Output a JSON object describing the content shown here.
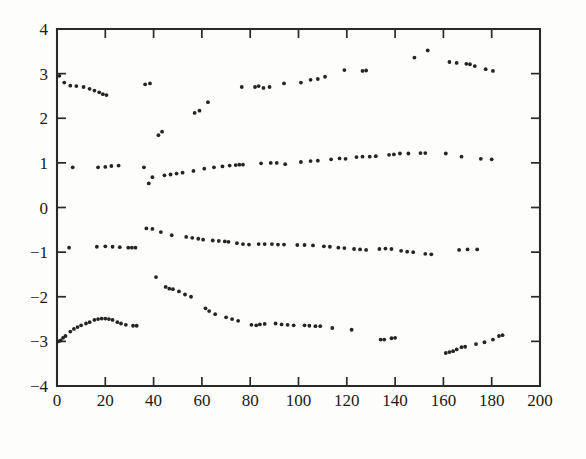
{
  "chart_data": {
    "type": "scatter",
    "title": "",
    "subtitle": "",
    "xlabel": "",
    "ylabel": "",
    "xlim": [
      0,
      200
    ],
    "ylim": [
      -4,
      4
    ],
    "grid": false,
    "legend": null,
    "legend_position": "none",
    "x_ticks": [
      0,
      20,
      40,
      60,
      80,
      100,
      120,
      140,
      160,
      180,
      200
    ],
    "x_tick_labels": [
      "0",
      "20",
      "40",
      "60",
      "80",
      "100",
      "120",
      "140",
      "160",
      "180",
      "200"
    ],
    "y_ticks": [
      -4,
      -3,
      -2,
      -1,
      0,
      1,
      2,
      3,
      4
    ],
    "y_tick_labels": [
      "−4",
      "−3",
      "−2",
      "−1",
      "0",
      "1",
      "2",
      "3",
      "4"
    ],
    "marker": "dot",
    "marker_size": 1.9,
    "marker_color": "#242424",
    "series": [
      {
        "name": "band-upper",
        "points": [
          [
            1.0,
            2.95
          ],
          [
            3.0,
            2.8
          ],
          [
            5.5,
            2.73
          ],
          [
            8.0,
            2.72
          ],
          [
            11.0,
            2.7
          ],
          [
            13.5,
            2.66
          ],
          [
            15.5,
            2.62
          ],
          [
            17.5,
            2.58
          ],
          [
            19.0,
            2.54
          ],
          [
            20.5,
            2.52
          ],
          [
            36.5,
            2.76
          ],
          [
            38.5,
            2.78
          ],
          [
            42.0,
            1.62
          ],
          [
            43.5,
            1.7
          ],
          [
            57.0,
            2.12
          ],
          [
            59.0,
            2.17
          ],
          [
            62.5,
            2.36
          ],
          [
            76.5,
            2.7
          ],
          [
            82.0,
            2.7
          ],
          [
            83.5,
            2.72
          ],
          [
            85.5,
            2.68
          ],
          [
            88.0,
            2.7
          ],
          [
            94.0,
            2.78
          ],
          [
            101.0,
            2.8
          ],
          [
            105.0,
            2.86
          ],
          [
            108.0,
            2.88
          ],
          [
            111.0,
            2.93
          ],
          [
            119.0,
            3.08
          ],
          [
            126.5,
            3.06
          ],
          [
            128.0,
            3.07
          ],
          [
            148.0,
            3.36
          ],
          [
            153.5,
            3.52
          ],
          [
            162.5,
            3.26
          ],
          [
            165.5,
            3.24
          ],
          [
            169.5,
            3.22
          ],
          [
            171.0,
            3.21
          ],
          [
            173.0,
            3.17
          ],
          [
            177.5,
            3.1
          ],
          [
            180.5,
            3.06
          ]
        ]
      },
      {
        "name": "band-one",
        "points": [
          [
            6.5,
            0.9
          ],
          [
            17.0,
            0.9
          ],
          [
            20.0,
            0.91
          ],
          [
            22.5,
            0.93
          ],
          [
            25.5,
            0.94
          ],
          [
            36.0,
            0.9
          ],
          [
            38.0,
            0.54
          ],
          [
            39.5,
            0.68
          ],
          [
            44.5,
            0.72
          ],
          [
            47.0,
            0.74
          ],
          [
            49.5,
            0.76
          ],
          [
            52.0,
            0.78
          ],
          [
            56.5,
            0.82
          ],
          [
            61.0,
            0.87
          ],
          [
            65.0,
            0.9
          ],
          [
            68.5,
            0.92
          ],
          [
            71.5,
            0.94
          ],
          [
            74.0,
            0.95
          ],
          [
            75.5,
            0.96
          ],
          [
            77.0,
            0.96
          ],
          [
            84.5,
            0.99
          ],
          [
            88.5,
            1.0
          ],
          [
            91.0,
            1.0
          ],
          [
            94.5,
            0.97
          ],
          [
            101.0,
            1.02
          ],
          [
            105.0,
            1.04
          ],
          [
            108.0,
            1.05
          ],
          [
            113.5,
            1.08
          ],
          [
            117.0,
            1.1
          ],
          [
            119.5,
            1.09
          ],
          [
            124.0,
            1.13
          ],
          [
            126.5,
            1.14
          ],
          [
            129.5,
            1.14
          ],
          [
            132.0,
            1.15
          ],
          [
            137.5,
            1.18
          ],
          [
            139.5,
            1.19
          ],
          [
            142.0,
            1.21
          ],
          [
            145.5,
            1.21
          ],
          [
            150.5,
            1.22
          ],
          [
            152.5,
            1.22
          ],
          [
            161.0,
            1.21
          ],
          [
            167.5,
            1.14
          ],
          [
            175.5,
            1.09
          ],
          [
            180.0,
            1.08
          ]
        ]
      },
      {
        "name": "band-minus-one",
        "points": [
          [
            5.0,
            -0.9
          ],
          [
            16.5,
            -0.88
          ],
          [
            20.0,
            -0.87
          ],
          [
            23.0,
            -0.88
          ],
          [
            26.0,
            -0.89
          ],
          [
            29.5,
            -0.9
          ],
          [
            31.0,
            -0.9
          ],
          [
            32.5,
            -0.9
          ],
          [
            37.0,
            -0.47
          ],
          [
            39.5,
            -0.48
          ],
          [
            43.0,
            -0.55
          ],
          [
            47.5,
            -0.62
          ],
          [
            53.5,
            -0.66
          ],
          [
            56.0,
            -0.68
          ],
          [
            58.5,
            -0.7
          ],
          [
            60.5,
            -0.72
          ],
          [
            64.5,
            -0.74
          ],
          [
            67.0,
            -0.75
          ],
          [
            69.5,
            -0.76
          ],
          [
            71.0,
            -0.77
          ],
          [
            74.5,
            -0.8
          ],
          [
            77.0,
            -0.82
          ],
          [
            79.5,
            -0.83
          ],
          [
            83.5,
            -0.82
          ],
          [
            86.0,
            -0.82
          ],
          [
            89.0,
            -0.82
          ],
          [
            91.5,
            -0.83
          ],
          [
            94.0,
            -0.83
          ],
          [
            99.5,
            -0.84
          ],
          [
            102.5,
            -0.84
          ],
          [
            106.0,
            -0.85
          ],
          [
            110.5,
            -0.87
          ],
          [
            113.0,
            -0.88
          ],
          [
            116.5,
            -0.9
          ],
          [
            119.0,
            -0.91
          ],
          [
            123.0,
            -0.93
          ],
          [
            125.5,
            -0.94
          ],
          [
            128.0,
            -0.95
          ],
          [
            133.5,
            -0.93
          ],
          [
            136.0,
            -0.92
          ],
          [
            138.5,
            -0.93
          ],
          [
            142.5,
            -0.97
          ],
          [
            145.0,
            -0.99
          ],
          [
            147.5,
            -1.0
          ],
          [
            152.5,
            -1.04
          ],
          [
            155.0,
            -1.05
          ],
          [
            166.5,
            -0.95
          ],
          [
            170.0,
            -0.94
          ],
          [
            174.0,
            -0.94
          ]
        ]
      },
      {
        "name": "band-lower",
        "points": [
          [
            0.5,
            -3.0
          ],
          [
            1.5,
            -2.98
          ],
          [
            2.5,
            -2.92
          ],
          [
            3.5,
            -2.88
          ],
          [
            5.5,
            -2.78
          ],
          [
            7.0,
            -2.72
          ],
          [
            8.5,
            -2.68
          ],
          [
            10.0,
            -2.64
          ],
          [
            12.0,
            -2.6
          ],
          [
            13.5,
            -2.57
          ],
          [
            15.5,
            -2.52
          ],
          [
            17.0,
            -2.5
          ],
          [
            18.5,
            -2.49
          ],
          [
            20.0,
            -2.49
          ],
          [
            21.5,
            -2.5
          ],
          [
            23.0,
            -2.52
          ],
          [
            25.0,
            -2.57
          ],
          [
            26.5,
            -2.6
          ],
          [
            28.5,
            -2.63
          ],
          [
            31.5,
            -2.65
          ],
          [
            33.0,
            -2.65
          ],
          [
            41.0,
            -1.56
          ],
          [
            45.0,
            -1.78
          ],
          [
            46.5,
            -1.82
          ],
          [
            48.0,
            -1.83
          ],
          [
            50.5,
            -1.88
          ],
          [
            53.0,
            -1.95
          ],
          [
            55.5,
            -2.0
          ],
          [
            61.5,
            -2.26
          ],
          [
            63.0,
            -2.32
          ],
          [
            65.5,
            -2.39
          ],
          [
            70.0,
            -2.46
          ],
          [
            72.5,
            -2.5
          ],
          [
            75.0,
            -2.54
          ],
          [
            80.5,
            -2.63
          ],
          [
            82.5,
            -2.64
          ],
          [
            84.0,
            -2.62
          ],
          [
            86.0,
            -2.61
          ],
          [
            90.5,
            -2.6
          ],
          [
            93.0,
            -2.62
          ],
          [
            95.5,
            -2.63
          ],
          [
            98.0,
            -2.64
          ],
          [
            102.5,
            -2.64
          ],
          [
            104.5,
            -2.65
          ],
          [
            107.0,
            -2.66
          ],
          [
            109.0,
            -2.66
          ],
          [
            114.0,
            -2.7
          ],
          [
            122.0,
            -2.74
          ],
          [
            134.0,
            -2.96
          ],
          [
            135.5,
            -2.96
          ],
          [
            138.5,
            -2.93
          ],
          [
            140.0,
            -2.92
          ],
          [
            161.0,
            -3.26
          ],
          [
            162.5,
            -3.24
          ],
          [
            164.0,
            -3.22
          ],
          [
            165.5,
            -3.18
          ],
          [
            167.5,
            -3.13
          ],
          [
            169.0,
            -3.12
          ],
          [
            173.5,
            -3.06
          ],
          [
            177.0,
            -3.02
          ],
          [
            180.5,
            -2.96
          ],
          [
            183.0,
            -2.88
          ],
          [
            184.5,
            -2.86
          ]
        ]
      }
    ]
  },
  "figure": {
    "plot_left_px": 57,
    "plot_right_px": 540,
    "plot_top_px": 29,
    "plot_bottom_px": 386
  }
}
